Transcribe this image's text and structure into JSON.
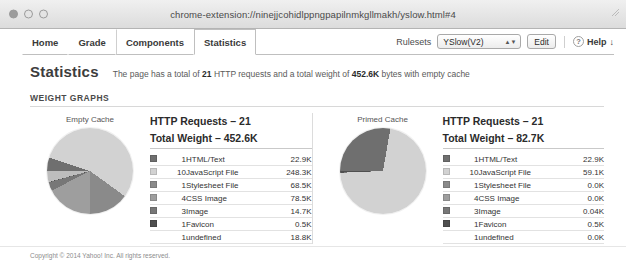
{
  "window": {
    "title": "chrome-extension://ninejjcohidlppngpapilnmkgllmakh/yslow.html#4",
    "close_label": "",
    "minimize_label": "",
    "zoom_label": ""
  },
  "toolbar": {
    "tabs": [
      {
        "label": "Home",
        "active": false
      },
      {
        "label": "Grade",
        "active": false
      },
      {
        "label": "Components",
        "active": false
      },
      {
        "label": "Statistics",
        "active": true
      }
    ],
    "rulesets_label": "Rulesets",
    "ruleset_selected": "YSlow(V2)",
    "edit_label": "Edit",
    "help_label": "Help",
    "help_arrow": "↓",
    "help_icon_glyph": "?"
  },
  "main": {
    "page_title": "Statistics",
    "summary_prefix": "The page has a total of",
    "summary_requests": "21",
    "summary_middle": "HTTP requests and a total weight of",
    "summary_weight": "452.6K",
    "summary_suffix": "bytes with empty cache",
    "section_label": "WEIGHT GRAPHS"
  },
  "panels": [
    {
      "pie_caption": "Empty Cache",
      "requests_line": "HTTP Requests – 21",
      "weight_line": "Total Weight – 452.6K",
      "rows": [
        {
          "count": "1",
          "type": "HTML/Text",
          "size": "22.9K",
          "color": "#6f6f6f"
        },
        {
          "count": "10",
          "type": "JavaScript File",
          "size": "248.3K",
          "color": "#d2d2d2"
        },
        {
          "count": "1",
          "type": "Stylesheet File",
          "size": "68.5K",
          "color": "#8a8a8a"
        },
        {
          "count": "4",
          "type": "CSS Image",
          "size": "78.5K",
          "color": "#9e9e9e"
        },
        {
          "count": "3",
          "type": "Image",
          "size": "14.7K",
          "color": "#777777"
        },
        {
          "count": "1",
          "type": "Favicon",
          "size": "0.5K",
          "color": "#4f4f4f"
        },
        {
          "count": "1",
          "type": "undefined",
          "size": "18.8K",
          "color": ""
        }
      ]
    },
    {
      "pie_caption": "Primed Cache",
      "requests_line": "HTTP Requests – 21",
      "weight_line": "Total Weight – 82.7K",
      "rows": [
        {
          "count": "1",
          "type": "HTML/Text",
          "size": "22.9K",
          "color": "#6f6f6f"
        },
        {
          "count": "10",
          "type": "JavaScript File",
          "size": "59.1K",
          "color": "#d2d2d2"
        },
        {
          "count": "1",
          "type": "Stylesheet File",
          "size": "0.0K",
          "color": "#8a8a8a"
        },
        {
          "count": "4",
          "type": "CSS Image",
          "size": "0.0K",
          "color": "#9e9e9e"
        },
        {
          "count": "3",
          "type": "Image",
          "size": "0.04K",
          "color": "#777777"
        },
        {
          "count": "1",
          "type": "Favicon",
          "size": "0.5K",
          "color": "#4f4f4f"
        },
        {
          "count": "1",
          "type": "undefined",
          "size": "0.0K",
          "color": ""
        }
      ]
    }
  ],
  "chart_data": [
    {
      "type": "pie",
      "title": "Empty Cache",
      "labels": [
        "HTML/Text",
        "JavaScript File",
        "Stylesheet File",
        "CSS Image",
        "Image",
        "Favicon",
        "undefined"
      ],
      "values": [
        22.9,
        248.3,
        68.5,
        78.5,
        14.7,
        0.5,
        18.8
      ],
      "unit": "K",
      "total": 452.6,
      "colors": [
        "#6f6f6f",
        "#d2d2d2",
        "#8a8a8a",
        "#9e9e9e",
        "#777777",
        "#4f4f4f",
        "#bdbdbd"
      ],
      "legend": "right-table"
    },
    {
      "type": "pie",
      "title": "Primed Cache",
      "labels": [
        "HTML/Text",
        "JavaScript File",
        "Stylesheet File",
        "CSS Image",
        "Image",
        "Favicon",
        "undefined"
      ],
      "values": [
        22.9,
        59.1,
        0.0,
        0.0,
        0.04,
        0.5,
        0.0
      ],
      "unit": "K",
      "total": 82.7,
      "colors": [
        "#6f6f6f",
        "#d2d2d2",
        "#8a8a8a",
        "#9e9e9e",
        "#777777",
        "#4f4f4f",
        "#bdbdbd"
      ],
      "legend": "right-table"
    }
  ],
  "footer": {
    "copyright": "Copyright © 2014 Yahoo! Inc. All rights reserved."
  }
}
